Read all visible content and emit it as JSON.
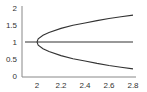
{
  "chart_data": {
    "type": "line",
    "title": "",
    "xlabel": "",
    "ylabel": "",
    "xlim": [
      1.88,
      2.82
    ],
    "ylim": [
      0,
      2
    ],
    "grid": false,
    "legend": null,
    "x_ticks": [
      "2",
      "2.2",
      "2.4",
      "2.6",
      "2.8"
    ],
    "y_ticks": [
      "0",
      "0.5",
      "1",
      "1.5",
      "2"
    ],
    "series": [
      {
        "name": "horizontal branch",
        "x": [
          1.9,
          2.0,
          2.2,
          2.4,
          2.6,
          2.8
        ],
        "y": [
          1.0,
          1.0,
          1.0,
          1.0,
          1.0,
          1.0
        ]
      },
      {
        "name": "upper branch",
        "x": [
          2.0,
          2.01,
          2.05,
          2.1,
          2.2,
          2.3,
          2.4,
          2.5,
          2.6,
          2.7,
          2.8
        ],
        "y": [
          1.0,
          1.09,
          1.2,
          1.28,
          1.4,
          1.49,
          1.56,
          1.63,
          1.69,
          1.74,
          1.79
        ]
      },
      {
        "name": "lower branch",
        "x": [
          2.0,
          2.01,
          2.05,
          2.1,
          2.2,
          2.3,
          2.4,
          2.5,
          2.6,
          2.7,
          2.8
        ],
        "y": [
          1.0,
          0.91,
          0.8,
          0.72,
          0.6,
          0.51,
          0.44,
          0.37,
          0.31,
          0.26,
          0.21
        ]
      }
    ]
  },
  "colors": {
    "axis": "#888888",
    "line": "#333333",
    "text": "#333333"
  }
}
